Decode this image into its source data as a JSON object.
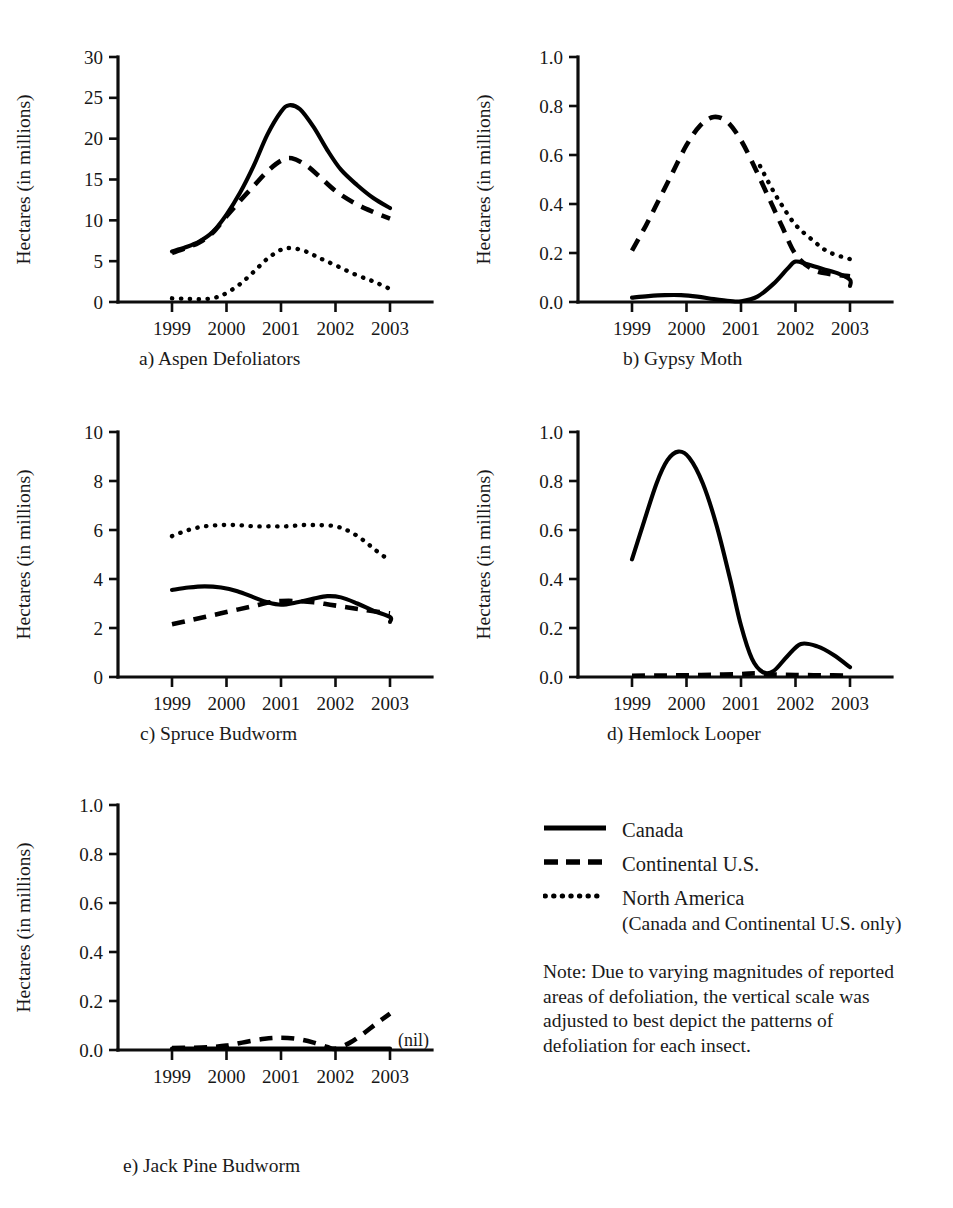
{
  "figure": {
    "axis_title_x": "Year",
    "axis_title_y": "Hectares (in millions)",
    "nil_marker": "(nil)"
  },
  "legend": {
    "items": [
      {
        "label": "Canada",
        "style": "solid",
        "sub": ""
      },
      {
        "label": "Continental U.S.",
        "style": "dashed",
        "sub": ""
      },
      {
        "label": "North America",
        "style": "dotted",
        "sub": "(Canada and Continental U.S. only)"
      }
    ]
  },
  "note": {
    "text": "Note: Due to varying magnitudes of reported areas of defoliation, the vertical scale was adjusted to best depict the patterns of defoliation for each insect."
  },
  "captions": {
    "a": "a) Aspen Defoliators",
    "b": "b) Gypsy Moth",
    "c": "c) Spruce Budworm",
    "d": "d) Hemlock Looper",
    "e": "e) Jack Pine Budworm"
  },
  "chart_data": [
    {
      "id": "a",
      "type": "line",
      "title": "a) Aspen Defoliators",
      "xlabel": "Year",
      "ylabel": "Hectares (in millions)",
      "xlim": [
        1999,
        2003
      ],
      "ylim": [
        0,
        30
      ],
      "yticks": [
        0,
        5,
        10,
        15,
        20,
        25,
        30
      ],
      "ytick_labels": [
        "0",
        "5",
        "10",
        "15",
        "20",
        "25",
        "30"
      ],
      "xticks": [
        1999,
        2000,
        2001,
        2002,
        2003
      ],
      "xtick_labels": [
        "1999",
        "2000",
        "2001",
        "2002",
        "2003"
      ],
      "grid": false,
      "legend_position": "external-bottom-right",
      "series": [
        {
          "name": "Canada",
          "style": "solid",
          "x": [
            1999.0,
            1999.25,
            1999.5,
            1999.75,
            2000.0,
            2000.25,
            2000.5,
            2000.75,
            2001.0,
            2001.15,
            2001.35,
            2001.6,
            2001.85,
            2002.1,
            2002.4,
            2002.7,
            2003.0
          ],
          "values": [
            6.2,
            6.7,
            7.4,
            8.6,
            10.7,
            13.4,
            16.7,
            20.5,
            23.3,
            24.1,
            23.6,
            21.4,
            18.6,
            16.2,
            14.3,
            12.7,
            11.5
          ]
        },
        {
          "name": "Continental U.S.",
          "style": "dashed",
          "x": [
            1999.0,
            1999.25,
            1999.5,
            1999.75,
            2000.0,
            2000.25,
            2000.5,
            2000.75,
            2001.0,
            2001.2,
            2001.45,
            2001.7,
            2002.0,
            2002.35,
            2002.7,
            2003.0
          ],
          "values": [
            6.0,
            6.6,
            7.3,
            8.5,
            10.5,
            12.4,
            14.2,
            16.0,
            17.3,
            17.6,
            16.8,
            15.4,
            13.6,
            12.1,
            11.0,
            10.2
          ]
        },
        {
          "name": "North America",
          "style": "dotted",
          "x": [
            1999.0,
            1999.2,
            1999.4,
            1999.6,
            1999.8,
            2000.0,
            2000.25,
            2000.5,
            2000.75,
            2001.0,
            2001.2,
            2001.45,
            2001.7,
            2002.0,
            2002.35,
            2002.7,
            2003.0
          ],
          "values": [
            0.45,
            0.4,
            0.35,
            0.35,
            0.55,
            1.1,
            2.2,
            3.7,
            5.3,
            6.4,
            6.6,
            6.2,
            5.4,
            4.5,
            3.4,
            2.5,
            1.6
          ]
        }
      ]
    },
    {
      "id": "b",
      "type": "line",
      "title": "b) Gypsy Moth",
      "xlabel": "Year",
      "ylabel": "Hectares (in millions)",
      "xlim": [
        1999,
        2003
      ],
      "ylim": [
        0.0,
        1.0
      ],
      "yticks": [
        0.0,
        0.2,
        0.4,
        0.6,
        0.8,
        1.0
      ],
      "ytick_labels": [
        "0.0",
        "0.2",
        "0.4",
        "0.6",
        "0.8",
        "1.0"
      ],
      "xticks": [
        1999,
        2000,
        2001,
        2002,
        2003
      ],
      "xtick_labels": [
        "1999",
        "2000",
        "2001",
        "2002",
        "2003"
      ],
      "grid": false,
      "series": [
        {
          "name": "Canada",
          "style": "solid",
          "x": [
            1999.0,
            1999.3,
            1999.6,
            1999.9,
            2000.2,
            2000.5,
            2000.8,
            2001.0,
            2001.3,
            2001.6,
            2001.85,
            2002.0,
            2002.2,
            2002.5,
            2002.8,
            3003.0,
            2003.0
          ],
          "values": [
            0.018,
            0.024,
            0.028,
            0.028,
            0.022,
            0.012,
            0.004,
            0.003,
            0.022,
            0.075,
            0.135,
            0.165,
            0.155,
            0.135,
            0.115,
            0.09,
            0.065
          ]
        },
        {
          "name": "Continental U.S.",
          "style": "dashed",
          "x": [
            1999.0,
            1999.25,
            1999.5,
            1999.75,
            2000.0,
            2000.25,
            2000.5,
            2000.75,
            2001.0,
            2001.25,
            2001.5,
            2001.75,
            2002.0,
            2002.3,
            2002.6,
            2003.0
          ],
          "values": [
            0.21,
            0.31,
            0.42,
            0.53,
            0.64,
            0.72,
            0.755,
            0.735,
            0.66,
            0.55,
            0.43,
            0.31,
            0.195,
            0.135,
            0.115,
            0.105
          ]
        },
        {
          "name": "North America",
          "style": "dotted",
          "x": [
            2001.35,
            2001.55,
            2001.75,
            2002.0,
            2002.3,
            2002.6,
            2003.0
          ],
          "values": [
            0.555,
            0.47,
            0.395,
            0.315,
            0.255,
            0.205,
            0.175
          ]
        }
      ]
    },
    {
      "id": "c",
      "type": "line",
      "title": "c) Spruce Budworm",
      "xlabel": "Year",
      "ylabel": "Hectares (in millions)",
      "xlim": [
        1999,
        2003
      ],
      "ylim": [
        0,
        10
      ],
      "yticks": [
        0,
        2,
        4,
        6,
        8,
        10
      ],
      "ytick_labels": [
        "0",
        "2",
        "4",
        "6",
        "8",
        "10"
      ],
      "xticks": [
        1999,
        2000,
        2001,
        2002,
        2003
      ],
      "xtick_labels": [
        "1999",
        "2000",
        "2001",
        "2002",
        "2003"
      ],
      "grid": false,
      "series": [
        {
          "name": "Canada",
          "style": "solid",
          "x": [
            1999.0,
            1999.3,
            1999.6,
            1999.9,
            2000.2,
            2000.5,
            2000.75,
            2001.0,
            2001.3,
            2001.6,
            2001.85,
            2002.1,
            2002.4,
            2002.7,
            3003.0,
            2003.0
          ],
          "values": [
            3.55,
            3.65,
            3.7,
            3.65,
            3.5,
            3.25,
            3.05,
            2.95,
            3.05,
            3.2,
            3.3,
            3.25,
            3.0,
            2.7,
            2.45,
            2.25
          ]
        },
        {
          "name": "Continental U.S.",
          "style": "dashed",
          "x": [
            1999.0,
            1999.3,
            1999.6,
            1999.9,
            2000.2,
            2000.5,
            2000.8,
            2001.0,
            2001.3,
            2001.6,
            2001.9,
            2002.2,
            2002.5,
            2002.8,
            2003.0
          ],
          "values": [
            2.15,
            2.3,
            2.45,
            2.6,
            2.75,
            2.9,
            3.05,
            3.1,
            3.1,
            3.05,
            2.95,
            2.85,
            2.75,
            2.65,
            2.6
          ]
        },
        {
          "name": "North America",
          "style": "dotted",
          "x": [
            1999.0,
            1999.3,
            1999.6,
            1999.9,
            2000.2,
            2000.5,
            2000.8,
            2001.1,
            2001.4,
            2001.7,
            2002.0,
            2002.25,
            2002.5,
            2002.75,
            2003.0
          ],
          "values": [
            5.75,
            6.0,
            6.15,
            6.2,
            6.2,
            6.15,
            6.15,
            6.15,
            6.2,
            6.2,
            6.15,
            5.95,
            5.6,
            5.15,
            4.75
          ]
        }
      ]
    },
    {
      "id": "d",
      "type": "line",
      "title": "d) Hemlock Looper",
      "xlabel": "Year",
      "ylabel": "Hectares (in millions)",
      "xlim": [
        1999,
        2003
      ],
      "ylim": [
        0.0,
        1.0
      ],
      "yticks": [
        0.0,
        0.2,
        0.4,
        0.6,
        0.8,
        1.0
      ],
      "ytick_labels": [
        "0.0",
        "0.2",
        "0.4",
        "0.6",
        "0.8",
        "1.0"
      ],
      "xticks": [
        1999,
        2000,
        2001,
        2002,
        2003
      ],
      "xtick_labels": [
        "1999",
        "2000",
        "2001",
        "2002",
        "2003"
      ],
      "grid": false,
      "series": [
        {
          "name": "Canada",
          "style": "solid",
          "x": [
            1999.0,
            1999.2,
            1999.45,
            1999.65,
            1999.85,
            2000.05,
            2000.3,
            2000.55,
            2000.8,
            2001.0,
            2001.2,
            2001.4,
            2001.6,
            2001.85,
            2002.1,
            2002.4,
            2002.7,
            2003.0
          ],
          "values": [
            0.48,
            0.62,
            0.79,
            0.885,
            0.92,
            0.895,
            0.79,
            0.62,
            0.4,
            0.21,
            0.075,
            0.02,
            0.025,
            0.085,
            0.135,
            0.125,
            0.09,
            0.04
          ]
        },
        {
          "name": "Continental U.S.",
          "style": "dashed",
          "x": [
            1999.0,
            1999.5,
            2000.0,
            2000.5,
            2001.0,
            2001.3,
            2001.6,
            2002.0,
            2002.5,
            2003.0
          ],
          "values": [
            0.005,
            0.006,
            0.007,
            0.009,
            0.012,
            0.015,
            0.01,
            0.008,
            0.007,
            0.006
          ]
        }
      ]
    },
    {
      "id": "e",
      "type": "line",
      "title": "e) Jack Pine Budworm",
      "xlabel": "Year",
      "ylabel": "Hectares (in millions)",
      "xlim": [
        1999,
        2003
      ],
      "ylim": [
        0.0,
        1.0
      ],
      "yticks": [
        0.0,
        0.2,
        0.4,
        0.6,
        0.8,
        1.0
      ],
      "ytick_labels": [
        "0.0",
        "0.2",
        "0.4",
        "0.6",
        "0.8",
        "1.0"
      ],
      "xticks": [
        1999,
        2000,
        2001,
        2002,
        2003
      ],
      "xtick_labels": [
        "1999",
        "2000",
        "2001",
        "2002",
        "2003"
      ],
      "grid": false,
      "annotation": "(nil)",
      "series": [
        {
          "name": "Canada",
          "style": "solid",
          "x": [
            1999.0,
            2000.0,
            2001.0,
            2002.0,
            2003.0
          ],
          "values": [
            0.006,
            0.006,
            0.006,
            0.006,
            0.006
          ]
        },
        {
          "name": "Continental U.S.",
          "style": "dashed",
          "x": [
            1999.0,
            1999.35,
            1999.7,
            2000.0,
            2000.35,
            2000.7,
            2001.0,
            2001.3,
            2001.6,
            2001.85,
            2002.0,
            2002.25,
            2002.5,
            2002.75,
            2003.0
          ],
          "values": [
            0.008,
            0.009,
            0.012,
            0.018,
            0.033,
            0.046,
            0.05,
            0.045,
            0.03,
            0.012,
            0.005,
            0.028,
            0.065,
            0.108,
            0.148
          ]
        }
      ]
    }
  ]
}
